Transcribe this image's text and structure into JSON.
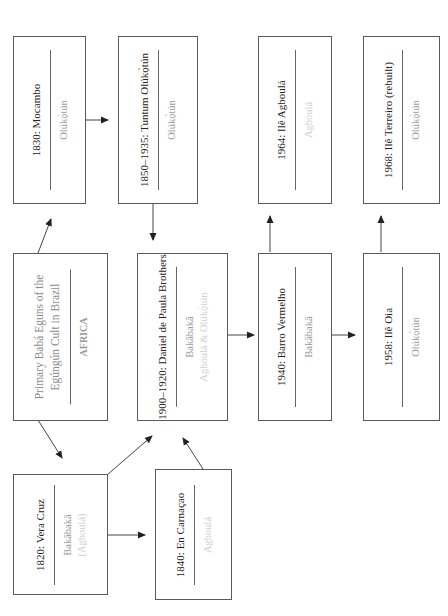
{
  "diagram": {
    "orientation": "rotated -90deg (read bottom-to-top)",
    "nodes": [
      {
        "id": "africa",
        "title_lines": [
          "Primary Babá Eguns of the",
          "Egúngún Cult in Brazil"
        ],
        "subtitle": [
          "AFRICA"
        ]
      },
      {
        "id": "vera_cruz",
        "title": "1820: Vera Cruz",
        "subtitle": [
          "Bakābakā",
          "(Agboulá)"
        ]
      },
      {
        "id": "carnacao",
        "title": "1840: En Carnaçao",
        "subtitle": [
          "Agboulá"
        ]
      },
      {
        "id": "mocambo",
        "title": "1830: Mocambo",
        "subtitle": [
          "Olúkọ̀tún"
        ]
      },
      {
        "id": "paula",
        "title": "1900–1920: Daniel de Paula Brothers",
        "subtitle": [
          "Bakābakā",
          "Agboulá & Olúkọ̀tún"
        ]
      },
      {
        "id": "tuntum",
        "title": "1850–1935: Tuntum Olúkọ̀tún",
        "subtitle": [
          "Olúkọ̀tún"
        ]
      },
      {
        "id": "barro",
        "title": "1940: Barro Vermelho",
        "subtitle": [
          "Bakābakā"
        ]
      },
      {
        "id": "agboula",
        "title": "1964: Ilê Agboulá",
        "subtitle": [
          "Agboulá"
        ]
      },
      {
        "id": "oia",
        "title": "1958: Ilê Oia",
        "subtitle": [
          "Olúkọ̀tún"
        ]
      },
      {
        "id": "terreiro",
        "title": "1968: Ilê Terreiro (rebuilt)",
        "subtitle": [
          "Olúkọ̀tún"
        ]
      }
    ],
    "edges": [
      [
        "africa",
        "mocambo"
      ],
      [
        "africa",
        "vera_cruz"
      ],
      [
        "mocambo",
        "tuntum"
      ],
      [
        "tuntum",
        "paula"
      ],
      [
        "vera_cruz",
        "paula"
      ],
      [
        "vera_cruz",
        "carnacao"
      ],
      [
        "carnacao",
        "paula"
      ],
      [
        "paula",
        "barro"
      ],
      [
        "barro",
        "agboula"
      ],
      [
        "barro",
        "oia"
      ],
      [
        "oia",
        "terreiro"
      ]
    ]
  }
}
